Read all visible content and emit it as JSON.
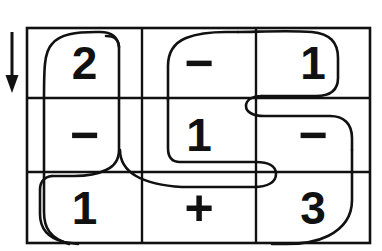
{
  "figure": {
    "type": "grid-with-traced-path",
    "background_color": "#ffffff",
    "ink_color": "#111111",
    "path_color": "#111111"
  },
  "arrow": {
    "name": "direction-arrow",
    "direction": "down",
    "x": 12,
    "y_start": 32,
    "y_end": 92
  },
  "grid": {
    "rows": 3,
    "cols": 3,
    "left": 27,
    "top": 28,
    "right": 370,
    "bottom": 243,
    "col_dividers": [
      142,
      256
    ],
    "row_dividers": [
      98,
      172
    ],
    "line_color": "#111111",
    "line_width": 2.4,
    "cells": [
      [
        {
          "id": "r1c1",
          "text": "2",
          "kind": "digit"
        },
        {
          "id": "r1c2",
          "text": "−",
          "kind": "operator"
        },
        {
          "id": "r1c3",
          "text": "1",
          "kind": "digit"
        }
      ],
      [
        {
          "id": "r2c1",
          "text": "−",
          "kind": "operator"
        },
        {
          "id": "r2c2",
          "text": "1",
          "kind": "digit"
        },
        {
          "id": "r2c3",
          "text": "−",
          "kind": "operator"
        }
      ],
      [
        {
          "id": "r3c1",
          "text": "1",
          "kind": "digit"
        },
        {
          "id": "r3c2",
          "text": "+",
          "kind": "operator"
        },
        {
          "id": "r3c3",
          "text": "3",
          "kind": "digit"
        }
      ]
    ],
    "reading_sequence": [
      "2",
      "−",
      "1",
      "−",
      "1",
      "−",
      "1",
      "+",
      "3"
    ]
  },
  "traced_path": {
    "name": "serpentine-trace",
    "stroke_width": 2.6,
    "segments": [
      "starts near top-left cell, rounds over the '2' cell",
      "descends along the right of column 1 through rows 1-2",
      "sweeps left across row 2/3 boundary and loops down into bottom-left",
      "runs right along the bottom of row 3",
      "rises into column 2 around the '1' cell",
      "u-turn at the column2/column3 border on the row1/row2 line",
      "continues right across row 2 past the '−'",
      "descends along the right edge and exits bottom-right under the '3'"
    ]
  }
}
